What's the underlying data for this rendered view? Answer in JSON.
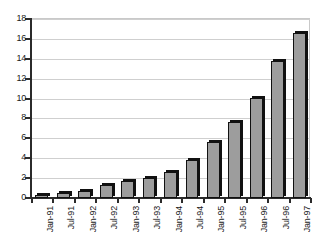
{
  "chart_data": {
    "type": "bar",
    "title": "",
    "subtitle": "",
    "xlabel": "",
    "ylabel": "",
    "categories": [
      "Jan-91",
      "Jul-91",
      "Jan-92",
      "Jul-92",
      "Jan-93",
      "Jul-93",
      "Jan-94",
      "Jul-94",
      "Jan-95",
      "Jul-95",
      "Jan-96",
      "Jul-96",
      "Jan-97"
    ],
    "values": [
      0.3,
      0.5,
      0.7,
      1.3,
      1.7,
      2.0,
      2.6,
      3.8,
      5.6,
      7.6,
      10.1,
      13.8,
      16.6
    ],
    "series": [
      {
        "name": "",
        "values": [
          0.3,
          0.5,
          0.7,
          1.3,
          1.7,
          2.0,
          2.6,
          3.8,
          5.6,
          7.6,
          10.1,
          13.8,
          16.6
        ]
      }
    ],
    "ylim": [
      0,
      18
    ],
    "xlim": [
      0,
      13
    ],
    "ytick_labels": [
      "0",
      "2",
      "4",
      "6",
      "8",
      "10",
      "12",
      "14",
      "16",
      "18"
    ],
    "ytick_values": [
      0,
      2,
      4,
      6,
      8,
      10,
      12,
      14,
      16,
      18
    ],
    "grid": true,
    "grid_axis": "y",
    "legend": false,
    "legend_position": "none",
    "annotations": [],
    "colors": {
      "bar_fill": "#9d9d9d",
      "bar_outline": "#111111",
      "bar_shadow": "#111111",
      "gridline": "#cfcfcf",
      "axis": "#2b2b2b",
      "background": "#ffffff",
      "tick_text": "#1a1a1a"
    }
  }
}
